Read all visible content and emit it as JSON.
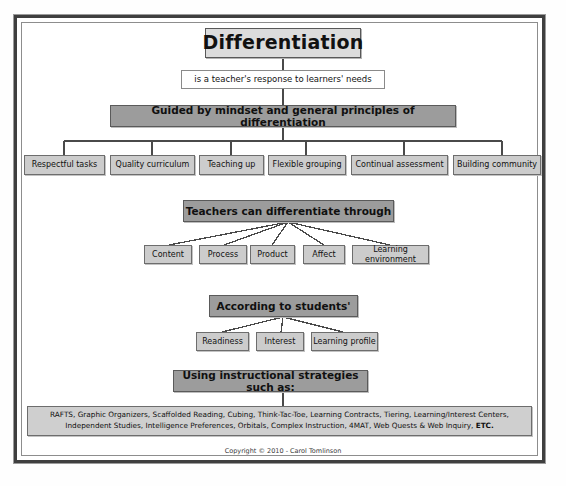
{
  "diagram": {
    "title": "Differentiation",
    "definition": "is a teacher's response to learners' needs",
    "section_guided": {
      "header": "Guided by mindset and general principles of differentiation",
      "items": [
        "Respectful tasks",
        "Quality curriculum",
        "Teaching up",
        "Flexible grouping",
        "Continual assessment",
        "Building community"
      ]
    },
    "section_through": {
      "header": "Teachers can differentiate through",
      "items": [
        "Content",
        "Process",
        "Product",
        "Affect",
        "Learning environment"
      ]
    },
    "section_according": {
      "header": "According to students'",
      "items": [
        "Readiness",
        "Interest",
        "Learning profile"
      ]
    },
    "section_strategies": {
      "header": "Using instructional strategies such as:",
      "line1": "RAFTS, Graphic Organizers, Scaffolded Reading, Cubing, Think-Tac-Toe, Learning Contracts, Tiering,  Learning/Interest Centers,",
      "line2_main": "Independent Studies, Intelligence Preferences, Orbitals, Complex Instruction, 4MAT, Web Quests & Web Inquiry, ",
      "line2_emphasis": "ETC."
    },
    "copyright": "Copyright © 2010 - Carol Tomlinson"
  },
  "colors": {
    "header_fill": "#9c9c9c",
    "leaf_fill": "#cccccc",
    "title_fill": "#dcdcdc",
    "frame": "#3f3f3f",
    "connector": "#4a4a4a"
  }
}
